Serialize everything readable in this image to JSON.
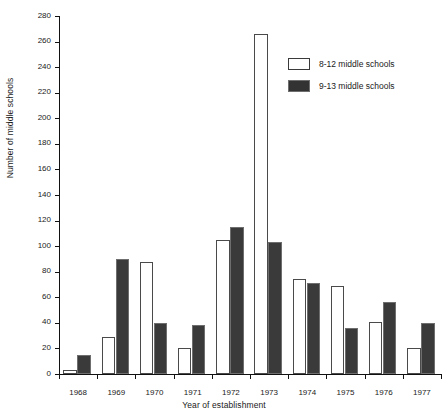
{
  "chart_data": {
    "type": "bar",
    "title": "",
    "xlabel": "Year of establishment",
    "ylabel": "Number of middle schools",
    "categories": [
      "1968",
      "1969",
      "1970",
      "1971",
      "1972",
      "1973",
      "1974",
      "1975",
      "1976",
      "1977"
    ],
    "series": [
      {
        "name": "8-12 middle schools",
        "color": "#ffffff",
        "values": [
          3,
          29,
          88,
          20,
          105,
          266,
          74,
          69,
          41,
          20
        ]
      },
      {
        "name": "9-13 middle schools",
        "color": "#3a3a3a",
        "values": [
          15,
          90,
          40,
          38,
          115,
          103,
          71,
          36,
          56,
          40
        ]
      }
    ],
    "ylim": [
      0,
      280
    ],
    "ytick_labels": [
      "0",
      "20",
      "40",
      "60",
      "80",
      "100",
      "120",
      "140",
      "160",
      "180",
      "200",
      "220",
      "240",
      "260",
      "280"
    ],
    "ytick_values": [
      0,
      20,
      40,
      60,
      80,
      100,
      120,
      140,
      160,
      180,
      200,
      220,
      240,
      260,
      280
    ],
    "grid": false,
    "legend_position": "top-right"
  },
  "legend": {
    "items": [
      {
        "label": "8-12 middle schools",
        "swatch": "light"
      },
      {
        "label": "9-13 middle schools",
        "swatch": "dark"
      }
    ]
  }
}
